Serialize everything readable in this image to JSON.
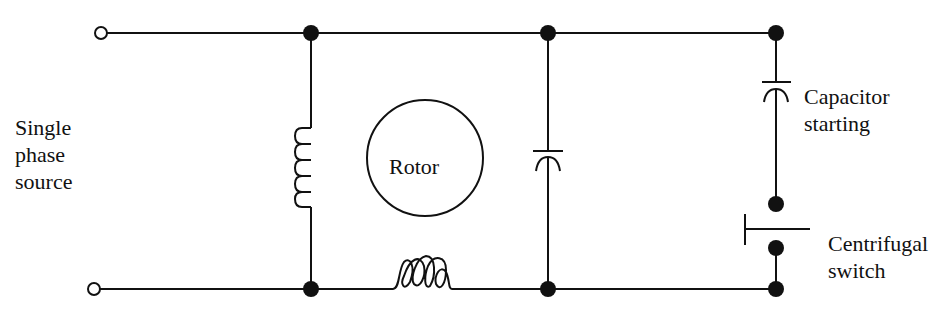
{
  "diagram": {
    "labels": {
      "source": [
        "Single",
        "phase",
        "source"
      ],
      "rotor": "Rotor",
      "capacitor_starting": [
        "Capacitor",
        "starting"
      ],
      "centrifugal_switch": [
        "Centrifugal",
        "switch"
      ]
    },
    "colors": {
      "stroke": "#111111",
      "background": "#ffffff"
    }
  }
}
